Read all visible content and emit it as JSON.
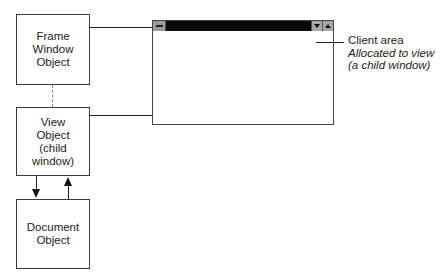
{
  "diagram": {
    "type": "object-relationship",
    "nodes": {
      "frame": {
        "lines": [
          "Frame",
          "Window",
          "Object"
        ]
      },
      "view": {
        "lines": [
          "View",
          "Object",
          "(child window)"
        ]
      },
      "document": {
        "lines": [
          "Document",
          "Object"
        ]
      }
    },
    "window_illustration": {
      "titlebar_buttons": [
        "system-menu",
        "minimize",
        "maximize"
      ]
    },
    "annotation": {
      "title": "Client area",
      "subtitle_lines": [
        "Allocated to view",
        "(a child window)"
      ]
    },
    "edges": [
      {
        "from": "frame",
        "to": "window-frame",
        "style": "solid"
      },
      {
        "from": "view",
        "to": "window-client-area",
        "style": "solid"
      },
      {
        "from": "frame",
        "to": "view",
        "style": "dashed"
      },
      {
        "from": "view",
        "to": "document",
        "style": "arrow"
      },
      {
        "from": "document",
        "to": "view",
        "style": "arrow"
      }
    ]
  }
}
